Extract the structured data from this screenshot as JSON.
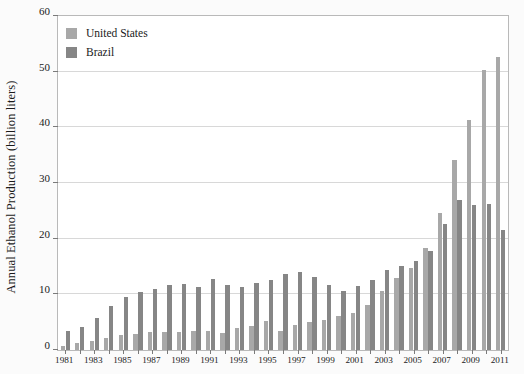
{
  "chart_data": {
    "type": "bar",
    "title": "",
    "xlabel": "",
    "ylabel": "Annual Ethanol Production (billion liters)",
    "ylim": [
      0,
      60
    ],
    "yticks": [
      0,
      10,
      20,
      30,
      40,
      50,
      60
    ],
    "grid": true,
    "legend_position": "top-left",
    "categories": [
      "1981",
      "1982",
      "1983",
      "1984",
      "1985",
      "1986",
      "1987",
      "1988",
      "1989",
      "1990",
      "1991",
      "1992",
      "1993",
      "1994",
      "1995",
      "1996",
      "1997",
      "1998",
      "1999",
      "2000",
      "2001",
      "2002",
      "2003",
      "2004",
      "2005",
      "2006",
      "2007",
      "2008",
      "2009",
      "2010",
      "2011"
    ],
    "xtick_labels": [
      "1981",
      "1983",
      "1985",
      "1987",
      "1989",
      "1991",
      "1993",
      "1995",
      "1997",
      "1999",
      "2001",
      "2003",
      "2005",
      "2007",
      "2009",
      "2011"
    ],
    "series": [
      {
        "name": "United States",
        "color": "#a8a8a8",
        "values": [
          0.8,
          1.3,
          1.6,
          2.2,
          2.7,
          2.8,
          3.2,
          3.2,
          3.2,
          3.4,
          3.5,
          3.1,
          3.9,
          4.4,
          5.2,
          3.5,
          4.5,
          5.1,
          5.4,
          6.2,
          6.7,
          8.1,
          10.6,
          12.9,
          14.8,
          18.4,
          24.6,
          34.1,
          41.4,
          50.3,
          52.6
        ]
      },
      {
        "name": "Brazil",
        "color": "#868686",
        "values": [
          3.4,
          4.2,
          5.8,
          7.9,
          9.5,
          10.5,
          11.0,
          11.7,
          11.8,
          11.4,
          12.7,
          11.6,
          11.3,
          12.1,
          12.6,
          13.7,
          14.0,
          13.1,
          11.7,
          10.6,
          11.5,
          12.6,
          14.4,
          15.1,
          16.0,
          17.8,
          22.6,
          27.0,
          26.0,
          26.2,
          21.5
        ]
      }
    ]
  },
  "legend": {
    "items": [
      {
        "label": "United States",
        "key": "us"
      },
      {
        "label": "Brazil",
        "key": "br"
      }
    ]
  }
}
